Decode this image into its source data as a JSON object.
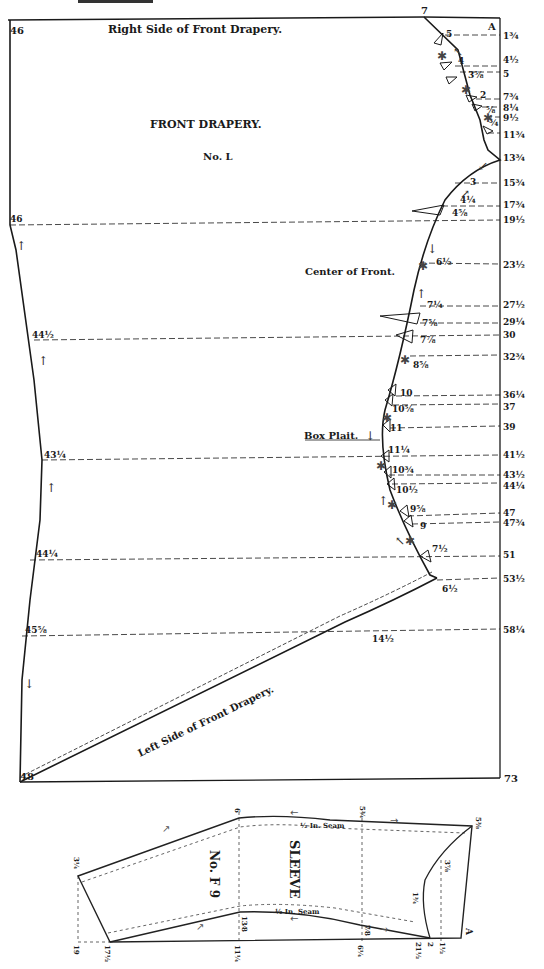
{
  "header": {
    "partial_title": "LADIES' DRAPERY"
  },
  "front_drapery": {
    "title": "FRONT DRAPERY.",
    "number": "No. L",
    "top_label": "Right Side of Front Drapery.",
    "bottom_label": "Left Side of Front Drapery.",
    "center_label": "Center of Front.",
    "plait_label": "Box Plait.",
    "corner_A": "A",
    "top_left": "46",
    "bottom_left": "48",
    "bottom_right": "73",
    "top_point": "7",
    "right_scale": [
      "1¾",
      "4½",
      "5",
      "7¾",
      "8¼",
      "9½",
      "11¾",
      "13¾",
      "15¾",
      "17¾",
      "19½",
      "23½",
      "27½",
      "29¼",
      "30",
      "32¾",
      "36¼",
      "37",
      "39",
      "41½",
      "43½",
      "44¼",
      "47",
      "47¾",
      "51",
      "53½",
      "58¼"
    ],
    "curve_points": [
      "5",
      "4",
      "3⅝",
      "2",
      "⅝",
      "¾",
      "3",
      "4¼",
      "4⅝",
      "6½",
      "7¼",
      "7⅝",
      "7⅞",
      "8⅝",
      "10",
      "10⅝",
      "11",
      "11¼",
      "10¾",
      "10½",
      "9⅝",
      "9",
      "7½",
      "6½",
      "14½"
    ],
    "left_scale": [
      "46",
      "44½",
      "43¼",
      "44¼",
      "45⅝"
    ]
  },
  "sleeve": {
    "title": "SLEEVE",
    "number": "No. F 9",
    "seam_top": "½ In. Seam",
    "seam_bottom": "½ In. Seam",
    "corner_A": "A",
    "labels": [
      "3¼",
      "19",
      "17½",
      "6",
      "13⁄8",
      "11¼",
      "5¾",
      "7⁄8",
      "6¼",
      "21½",
      "2",
      "1½",
      "3⅞",
      "1¾",
      "5⅜"
    ]
  }
}
